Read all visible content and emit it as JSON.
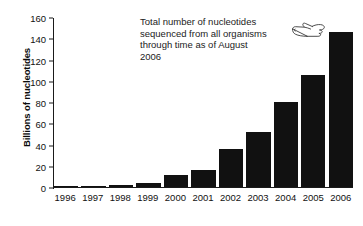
{
  "chart_data": {
    "type": "bar",
    "title": "",
    "subtitle": "",
    "xlabel": "",
    "ylabel": "Billions of nucleotides",
    "categories": [
      "1996",
      "1997",
      "1998",
      "1999",
      "2000",
      "2001",
      "2002",
      "2003",
      "2004",
      "2005",
      "2006"
    ],
    "values": [
      1,
      1,
      2,
      4,
      11,
      16,
      36,
      52,
      80,
      105,
      146
    ],
    "series": [
      {
        "name": "Total nucleotides sequenced",
        "values": [
          1,
          1,
          2,
          4,
          11,
          16,
          36,
          52,
          80,
          105,
          146
        ]
      }
    ],
    "ylim": [
      0,
      160
    ],
    "yticks": [
      0,
      20,
      40,
      60,
      80,
      100,
      120,
      140,
      160
    ],
    "ytick_labels": [
      "0",
      "20",
      "40",
      "60",
      "80",
      "100",
      "120",
      "140",
      "160"
    ],
    "xtick_labels": [
      "1996",
      "1997",
      "1998",
      "1999",
      "2000",
      "2001",
      "2002",
      "2003",
      "2004",
      "2005",
      "2006"
    ],
    "grid": false,
    "legend": false,
    "legend_position": "none",
    "bar_color": "#111111",
    "axis_color": "#1a1a1a",
    "annotations": [
      {
        "name": "total-nucleotides-note",
        "lines": [
          "Total number of nucleotides",
          "sequenced from all organisms",
          "through time as of August",
          "2006"
        ],
        "icon": "pointing-hand-icon",
        "points_to": "2006"
      }
    ]
  },
  "axis": {
    "y_title": "Billions of nucleotides"
  },
  "annotation": {
    "line1": "Total number of nucleotides",
    "line2": "sequenced from all organisms",
    "line3": "through time as of August",
    "line4": "2006"
  }
}
